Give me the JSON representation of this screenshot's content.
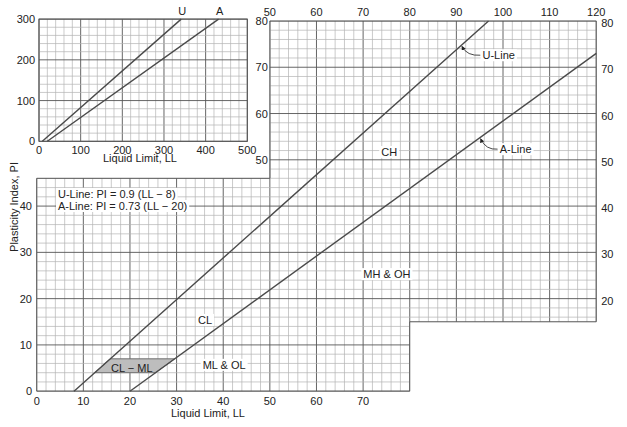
{
  "chart_data": {
    "type": "line",
    "title": "",
    "main": {
      "xlabel": "Liquid Limit, LL",
      "ylabel": "Plasticity Index, PI",
      "xlim": [
        0,
        120
      ],
      "ylim": [
        0,
        80
      ],
      "grid": true,
      "grid_minor_step": 2,
      "grid_major_step": 10,
      "regions": [
        {
          "x": [
            0,
            80
          ],
          "y": [
            0,
            46
          ]
        },
        {
          "x": [
            50,
            120
          ],
          "y": [
            15,
            80
          ]
        }
      ],
      "outline": [
        [
          0,
          0
        ],
        [
          80,
          0
        ],
        [
          80,
          15
        ],
        [
          120,
          15
        ],
        [
          120,
          80
        ],
        [
          50,
          80
        ],
        [
          50,
          46
        ],
        [
          0,
          46
        ]
      ],
      "x_ticks_bottom": [
        0,
        10,
        20,
        30,
        40,
        50,
        60,
        70
      ],
      "x_ticks_top": [
        50,
        60,
        70,
        80,
        90,
        100,
        110,
        120
      ],
      "y_ticks_left": [
        0,
        10,
        20,
        30,
        40
      ],
      "y_ticks_left_upper": [
        50,
        60,
        70,
        80
      ],
      "y_ticks_right": [
        20,
        30,
        40,
        50,
        60,
        70,
        80
      ]
    },
    "series": [
      {
        "name": "U-Line",
        "equation": "U-Line: PI = 0.9 (LL − 8)",
        "slope": 0.9,
        "x_intercept": 8,
        "points": [
          [
            8,
            0
          ],
          [
            96.9,
            80
          ]
        ]
      },
      {
        "name": "A-Line",
        "equation": "A-Line: PI = 0.73 (LL − 20)",
        "slope": 0.73,
        "x_intercept": 20,
        "points": [
          [
            20,
            0
          ],
          [
            120,
            73
          ]
        ]
      }
    ],
    "callouts": [
      {
        "label": "U-Line",
        "text_at": [
          95.6,
          72.6
        ],
        "tip": [
          91,
          74.7
        ]
      },
      {
        "label": "A-Line",
        "text_at": [
          99.3,
          52.3
        ],
        "tip": [
          95,
          54.75
        ]
      }
    ],
    "zones": [
      {
        "label": "CH",
        "at": [
          75.6,
          51.7
        ]
      },
      {
        "label": "MH & OH",
        "at": [
          75.1,
          25.3
        ]
      },
      {
        "label": "CL",
        "at": [
          36.1,
          15.4
        ]
      },
      {
        "label": "ML & OL",
        "at": [
          40.2,
          5.7
        ]
      },
      {
        "label": "CL − ML",
        "at": [
          20.4,
          5.0
        ],
        "shaded": true,
        "polygon": [
          [
            12.44,
            4
          ],
          [
            15.78,
            7
          ],
          [
            29.59,
            7
          ],
          [
            25.48,
            4
          ]
        ],
        "fill": "#bdbdbd"
      }
    ],
    "equations_box": {
      "lines": [
        "U-Line: PI = 0.9 (LL − 8)",
        "A-Line: PI = 0.73 (LL − 20)"
      ],
      "at": [
        58,
        194
      ]
    },
    "inset": {
      "xlabel": "Liquid Limit, LL",
      "xlim": [
        0,
        500
      ],
      "ylim": [
        0,
        300
      ],
      "grid": true,
      "grid_minor_step": 20,
      "grid_major_step": 100,
      "x_ticks": [
        0,
        100,
        200,
        300,
        400,
        500
      ],
      "y_ticks": [
        0,
        100,
        200,
        300
      ],
      "series": [
        {
          "name": "U",
          "points": [
            [
              8,
              0
            ],
            [
              341.3,
              300
            ]
          ]
        },
        {
          "name": "A",
          "points": [
            [
              20,
              0
            ],
            [
              431,
              300
            ]
          ]
        }
      ]
    }
  }
}
